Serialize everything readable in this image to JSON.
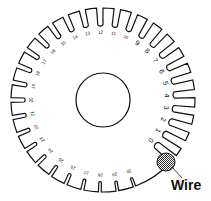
{
  "diagram": {
    "center_hole": true,
    "gauge_numbers": [
      "0",
      "1",
      "2",
      "3",
      "4",
      "5",
      "6",
      "7",
      "8",
      "9",
      "10",
      "11",
      "12",
      "13",
      "14",
      "15",
      "16",
      "17",
      "18",
      "19",
      "20",
      "21",
      "22",
      "23",
      "24",
      "25",
      "26",
      "27",
      "28",
      "29",
      "30"
    ],
    "wire_label": "Wire",
    "colors": {
      "line": "#111111",
      "background": "#ffffff"
    }
  }
}
